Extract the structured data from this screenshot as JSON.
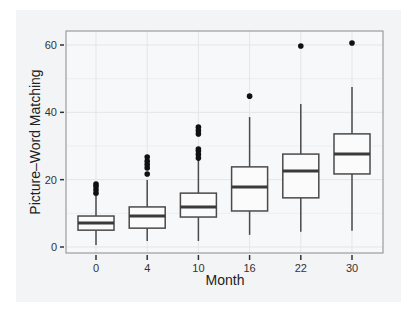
{
  "chart_data": {
    "type": "boxplot",
    "title": "",
    "xlabel": "Month",
    "ylabel": "Picture–Word Matching",
    "categories": [
      "0",
      "4",
      "10",
      "16",
      "22",
      "30"
    ],
    "yticks": [
      0,
      20,
      40,
      60
    ],
    "ylim": [
      -2,
      64
    ],
    "grid": true,
    "legend": null,
    "series": [
      {
        "category": "0",
        "min": 0.6,
        "q1": 5.0,
        "median": 7.1,
        "q3": 9.2,
        "max": 15.4,
        "outliers": [
          16,
          17,
          18,
          18.7
        ]
      },
      {
        "category": "4",
        "min": 1.8,
        "q1": 5.6,
        "median": 9.2,
        "q3": 11.9,
        "max": 19.9,
        "outliers": [
          21.7,
          23.5,
          24.5,
          25.5,
          26.7
        ]
      },
      {
        "category": "10",
        "min": 1.8,
        "q1": 8.9,
        "median": 11.9,
        "q3": 16.0,
        "max": 25.8,
        "outliers": [
          26.4,
          27.5,
          28.5,
          29.1,
          33.6,
          34.6,
          35.6
        ]
      },
      {
        "category": "16",
        "min": 3.6,
        "q1": 10.7,
        "median": 17.8,
        "q3": 23.8,
        "max": 38.6,
        "outliers": [
          44.8
        ]
      },
      {
        "category": "22",
        "min": 4.5,
        "q1": 14.6,
        "median": 22.6,
        "q3": 27.6,
        "max": 42.5,
        "outliers": [
          59.7
        ]
      },
      {
        "category": "30",
        "min": 4.8,
        "q1": 21.7,
        "median": 27.6,
        "q3": 33.6,
        "max": 47.5,
        "outliers": [
          60.6
        ]
      }
    ],
    "colors": {
      "panel_background": "#f7f8f9",
      "panel_border": "#8a8a8a",
      "grid": "#e3e5e8",
      "box_stroke": "#4a4a4a",
      "median": "#3a3a3a",
      "outlier": "#111111"
    }
  }
}
